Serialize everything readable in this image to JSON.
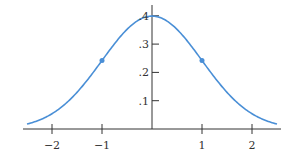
{
  "chart_data": {
    "type": "line",
    "title": "",
    "xlabel": "",
    "ylabel": "",
    "series": [
      {
        "name": "standard normal density",
        "function": "exp(-x^2/2)/sqrt(2*pi)",
        "x_range": [
          -2.5,
          2.5
        ],
        "color": "#4a8fd6"
      }
    ],
    "marked_points": [
      {
        "x": -1,
        "y": 0.242
      },
      {
        "x": 1,
        "y": 0.242
      }
    ],
    "xlim": [
      -2.6,
      2.6
    ],
    "ylim": [
      0,
      0.42
    ],
    "x_ticks": [
      -2,
      -1,
      1,
      2
    ],
    "x_tick_labels": [
      "−2",
      "−1",
      "1",
      "2"
    ],
    "y_ticks": [
      0.1,
      0.2,
      0.3,
      0.4
    ],
    "y_tick_labels": [
      ".1",
      ".2",
      ".3",
      ".4"
    ],
    "grid": false,
    "legend": "none"
  },
  "colors": {
    "curve": "#4a8fd6",
    "axis": "#333333"
  }
}
